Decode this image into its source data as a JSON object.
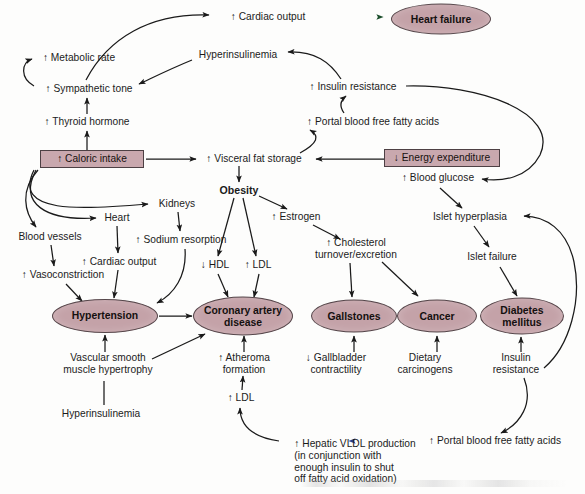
{
  "diagram": {
    "type": "flowchart",
    "colors": {
      "ellipse_fill": "#c4a2a8",
      "box_fill": "#c9a8ae",
      "node_stroke": "#55464a",
      "edge_stroke": "#1a1a1a",
      "text": "#1b1b1b",
      "background": "#fdfdfc",
      "accent_green_arrow": "#2fa84a",
      "accent_blue_arrow": "#3a4fa0"
    },
    "nodes": [
      {
        "id": "caloric_intake",
        "label": "↑ Caloric intake",
        "shape": "box",
        "x": 92,
        "y": 159,
        "w": 104,
        "h": 18
      },
      {
        "id": "energy_expenditure",
        "label": "↓ Energy expenditure",
        "shape": "box",
        "x": 442,
        "y": 158,
        "w": 116,
        "h": 18
      },
      {
        "id": "heart_failure",
        "label": "Heart failure",
        "shape": "ellipse",
        "x": 441,
        "y": 19,
        "w": 98,
        "h": 29
      },
      {
        "id": "hypertension",
        "label": "Hypertension",
        "shape": "ellipse",
        "x": 105,
        "y": 316,
        "w": 104,
        "h": 32
      },
      {
        "id": "coronary_artery",
        "label": "Coronary artery\ndisease",
        "shape": "ellipse",
        "x": 243,
        "y": 316,
        "w": 98,
        "h": 37
      },
      {
        "id": "gallstones",
        "label": "Gallstones",
        "shape": "ellipse",
        "x": 354,
        "y": 316,
        "w": 84,
        "h": 31
      },
      {
        "id": "cancer",
        "label": "Cancer",
        "shape": "ellipse",
        "x": 437,
        "y": 316,
        "w": 78,
        "h": 31
      },
      {
        "id": "diabetes_mellitus",
        "label": "Diabetes\nmellitus",
        "shape": "ellipse",
        "x": 522,
        "y": 316,
        "w": 82,
        "h": 35
      },
      {
        "id": "cardiac_output_top",
        "label": "↑ Cardiac output",
        "shape": "text",
        "x": 268,
        "y": 17
      },
      {
        "id": "metabolic_rate",
        "label": "↑ Metabolic rate",
        "shape": "text",
        "x": 79,
        "y": 58
      },
      {
        "id": "hyperinsulinemia_top",
        "label": "Hyperinsulinemia",
        "shape": "text",
        "x": 238,
        "y": 55
      },
      {
        "id": "sympathetic_tone",
        "label": "↑ Sympathetic tone",
        "shape": "text",
        "x": 89,
        "y": 89
      },
      {
        "id": "insulin_resistance_top",
        "label": "↑ Insulin resistance",
        "shape": "text",
        "x": 353,
        "y": 87
      },
      {
        "id": "thyroid_hormone",
        "label": "↑ Thyroid hormone",
        "shape": "text",
        "x": 87,
        "y": 122
      },
      {
        "id": "portal_ffa_top",
        "label": "↑ Portal blood free fatty acids",
        "shape": "text",
        "x": 373,
        "y": 122
      },
      {
        "id": "visceral_fat",
        "label": "↑ Visceral fat storage",
        "shape": "text",
        "x": 254,
        "y": 159
      },
      {
        "id": "blood_glucose",
        "label": "↑ Blood glucose",
        "shape": "text",
        "x": 438,
        "y": 178
      },
      {
        "id": "obesity",
        "label": "Obesity",
        "shape": "bold",
        "x": 239,
        "y": 190
      },
      {
        "id": "kidneys",
        "label": "Kidneys",
        "shape": "text",
        "x": 177,
        "y": 204
      },
      {
        "id": "heart",
        "label": "Heart",
        "shape": "text",
        "x": 117,
        "y": 218
      },
      {
        "id": "estrogen",
        "label": "↑ Estrogen",
        "shape": "text",
        "x": 296,
        "y": 217
      },
      {
        "id": "islet_hyperplasia",
        "label": "Islet hyperplasia",
        "shape": "text",
        "x": 470,
        "y": 217
      },
      {
        "id": "blood_vessels",
        "label": "Blood vessels",
        "shape": "text",
        "x": 50,
        "y": 237
      },
      {
        "id": "sodium_resorption",
        "label": "↑ Sodium resorption",
        "shape": "text",
        "x": 181,
        "y": 240
      },
      {
        "id": "cholesterol_turnover",
        "label": "↑ Cholesterol\nturnover/excretion",
        "shape": "text",
        "x": 356,
        "y": 249
      },
      {
        "id": "islet_failure",
        "label": "Islet failure",
        "shape": "text",
        "x": 492,
        "y": 257
      },
      {
        "id": "hdl",
        "label": "↓ HDL",
        "shape": "text",
        "x": 215,
        "y": 265
      },
      {
        "id": "ldl_top",
        "label": "↑ LDL",
        "shape": "text",
        "x": 258,
        "y": 265
      },
      {
        "id": "cardiac_output_left",
        "label": "↑ Cardiac output",
        "shape": "text",
        "x": 119,
        "y": 262
      },
      {
        "id": "vasoconstriction",
        "label": "↑ Vasoconstriction",
        "shape": "text",
        "x": 63,
        "y": 275
      },
      {
        "id": "vascular_hypertrophy",
        "label": "Vascular smooth\nmuscle hypertrophy",
        "shape": "text",
        "x": 108,
        "y": 364
      },
      {
        "id": "atheroma_formation",
        "label": "↑ Atheroma\nformation",
        "shape": "text",
        "x": 244,
        "y": 364
      },
      {
        "id": "gallbladder",
        "label": "↓ Gallbladder\ncontractility",
        "shape": "text",
        "x": 336,
        "y": 364
      },
      {
        "id": "dietary_carcinogens",
        "label": "Dietary\ncarcinogens",
        "shape": "text",
        "x": 425,
        "y": 364
      },
      {
        "id": "insulin_resistance_bot",
        "label": "Insulin\nresistance",
        "shape": "text",
        "x": 516,
        "y": 364
      },
      {
        "id": "ldl_bottom",
        "label": "↑ LDL",
        "shape": "text",
        "x": 241,
        "y": 398
      },
      {
        "id": "hyperinsulinemia_bot",
        "label": "Hyperinsulinemia",
        "shape": "text",
        "x": 101,
        "y": 414
      },
      {
        "id": "hepatic_vldl",
        "label": "↑ Hepatic VLDL production\n(in conjunction with\nenough insulin to shut\noff fatty acid oxidation)",
        "shape": "text",
        "x": 355,
        "y": 462
      },
      {
        "id": "portal_ffa_bottom",
        "label": "↑ Portal blood free fatty acids",
        "shape": "text",
        "x": 495,
        "y": 441
      }
    ],
    "edges": [
      {
        "from": "sympathetic_tone",
        "to": "cardiac_output_top"
      },
      {
        "from": "cardiac_output_top",
        "to": "heart_failure",
        "color": "green"
      },
      {
        "from": "sympathetic_tone",
        "to": "metabolic_rate"
      },
      {
        "from": "hyperinsulinemia_top",
        "to": "sympathetic_tone"
      },
      {
        "from": "insulin_resistance_top",
        "to": "hyperinsulinemia_top"
      },
      {
        "from": "thyroid_hormone",
        "to": "sympathetic_tone"
      },
      {
        "from": "caloric_intake",
        "to": "thyroid_hormone"
      },
      {
        "from": "caloric_intake",
        "to": "visceral_fat"
      },
      {
        "from": "caloric_intake",
        "to": "blood_vessels"
      },
      {
        "from": "caloric_intake",
        "to": "heart"
      },
      {
        "from": "caloric_intake",
        "to": "kidneys"
      },
      {
        "from": "energy_expenditure",
        "to": "visceral_fat"
      },
      {
        "from": "visceral_fat",
        "to": "portal_ffa_top"
      },
      {
        "from": "portal_ffa_top",
        "to": "insulin_resistance_top"
      },
      {
        "from": "insulin_resistance_top",
        "to": "blood_glucose"
      },
      {
        "from": "visceral_fat",
        "to": "obesity"
      },
      {
        "from": "obesity",
        "to": "hdl"
      },
      {
        "from": "obesity",
        "to": "ldl_top"
      },
      {
        "from": "obesity",
        "to": "estrogen"
      },
      {
        "from": "estrogen",
        "to": "cholesterol_turnover"
      },
      {
        "from": "cholesterol_turnover",
        "to": "gallstones"
      },
      {
        "from": "cholesterol_turnover",
        "to": "cancer"
      },
      {
        "from": "hdl",
        "to": "coronary_artery"
      },
      {
        "from": "ldl_top",
        "to": "coronary_artery"
      },
      {
        "from": "kidneys",
        "to": "sodium_resorption"
      },
      {
        "from": "sodium_resorption",
        "to": "hypertension"
      },
      {
        "from": "heart",
        "to": "cardiac_output_left"
      },
      {
        "from": "cardiac_output_left",
        "to": "hypertension"
      },
      {
        "from": "blood_vessels",
        "to": "vasoconstriction"
      },
      {
        "from": "vasoconstriction",
        "to": "hypertension"
      },
      {
        "from": "hypertension",
        "to": "coronary_artery"
      },
      {
        "from": "vascular_hypertrophy",
        "to": "hypertension"
      },
      {
        "from": "vascular_hypertrophy",
        "to": "coronary_artery"
      },
      {
        "from": "hyperinsulinemia_bot",
        "to": "vascular_hypertrophy"
      },
      {
        "from": "atheroma_formation",
        "to": "coronary_artery"
      },
      {
        "from": "ldl_bottom",
        "to": "atheroma_formation"
      },
      {
        "from": "hepatic_vldl",
        "to": "ldl_bottom"
      },
      {
        "from": "portal_ffa_bottom",
        "to": "hepatic_vldl",
        "color": "blue"
      },
      {
        "from": "gallbladder",
        "to": "gallstones"
      },
      {
        "from": "dietary_carcinogens",
        "to": "cancer"
      },
      {
        "from": "insulin_resistance_bot",
        "to": "diabetes_mellitus"
      },
      {
        "from": "insulin_resistance_bot",
        "to": "portal_ffa_bottom"
      },
      {
        "from": "insulin_resistance_bot",
        "to": "islet_hyperplasia"
      },
      {
        "from": "blood_glucose",
        "to": "islet_hyperplasia"
      },
      {
        "from": "islet_hyperplasia",
        "to": "islet_failure"
      },
      {
        "from": "islet_failure",
        "to": "diabetes_mellitus"
      }
    ]
  }
}
